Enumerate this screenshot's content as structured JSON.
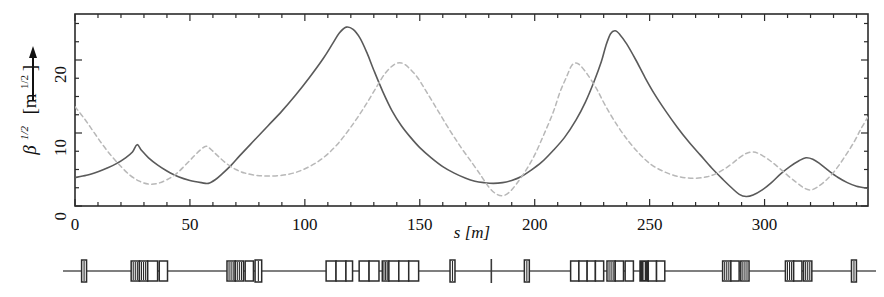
{
  "figure": {
    "title": "",
    "ylabel_main": "β",
    "ylabel_exp": "1/2",
    "ylabel_unit_open": " [m",
    "ylabel_unit_exp": "1/2",
    "ylabel_unit_close": "]",
    "xlabel": "s [m]",
    "arrow_icon": "up-arrow-icon"
  },
  "chart_data": {
    "type": "line",
    "title": "",
    "xlabel": "s [m]",
    "ylabel": "β^1/2 [m^1/2]",
    "xlim": [
      0,
      345
    ],
    "ylim": [
      0,
      26.3
    ],
    "xticks": [
      0,
      50,
      100,
      150,
      200,
      250,
      300
    ],
    "xtick_labels": [
      "0",
      "50",
      "100",
      "150",
      "200",
      "250",
      "300"
    ],
    "xminor_step": 10,
    "yticks": [
      0,
      10,
      20
    ],
    "ytick_labels": [
      "0",
      "10",
      "20"
    ],
    "yminor_step": 2.5,
    "grid": false,
    "legend": "none",
    "series": [
      {
        "name": "beta_x_sqrt",
        "style": "solid",
        "color": "#5a5a5a",
        "width": 1.6,
        "points": [
          [
            0,
            3.9
          ],
          [
            5,
            4.2
          ],
          [
            10,
            4.7
          ],
          [
            14,
            5.2
          ],
          [
            18,
            5.8
          ],
          [
            22,
            6.6
          ],
          [
            25,
            7.4
          ],
          [
            27,
            8.4
          ],
          [
            29,
            7.6
          ],
          [
            32,
            6.6
          ],
          [
            36,
            5.6
          ],
          [
            40,
            4.8
          ],
          [
            45,
            4.0
          ],
          [
            50,
            3.5
          ],
          [
            55,
            3.2
          ],
          [
            58,
            3.1
          ],
          [
            61,
            3.6
          ],
          [
            64,
            4.4
          ],
          [
            68,
            5.6
          ],
          [
            72,
            7.0
          ],
          [
            78,
            9.0
          ],
          [
            84,
            11.0
          ],
          [
            90,
            13.0
          ],
          [
            96,
            15.2
          ],
          [
            102,
            17.6
          ],
          [
            108,
            20.2
          ],
          [
            112,
            22.2
          ],
          [
            115,
            23.7
          ],
          [
            118,
            24.5
          ],
          [
            121,
            24.2
          ],
          [
            124,
            23.0
          ],
          [
            127,
            21.0
          ],
          [
            130,
            18.6
          ],
          [
            134,
            15.6
          ],
          [
            138,
            13.0
          ],
          [
            142,
            11.0
          ],
          [
            146,
            9.4
          ],
          [
            150,
            8.0
          ],
          [
            155,
            6.6
          ],
          [
            160,
            5.4
          ],
          [
            165,
            4.5
          ],
          [
            170,
            3.8
          ],
          [
            174,
            3.4
          ],
          [
            178,
            3.2
          ],
          [
            182,
            3.1
          ],
          [
            186,
            3.2
          ],
          [
            190,
            3.5
          ],
          [
            194,
            4.0
          ],
          [
            198,
            4.8
          ],
          [
            203,
            6.0
          ],
          [
            208,
            7.6
          ],
          [
            213,
            9.4
          ],
          [
            218,
            11.8
          ],
          [
            222,
            14.2
          ],
          [
            226,
            17.2
          ],
          [
            229,
            19.8
          ],
          [
            231,
            22.0
          ],
          [
            233,
            23.6
          ],
          [
            235,
            24.0
          ],
          [
            237,
            23.5
          ],
          [
            240,
            22.2
          ],
          [
            244,
            20.0
          ],
          [
            248,
            17.6
          ],
          [
            252,
            15.4
          ],
          [
            257,
            13.0
          ],
          [
            262,
            10.8
          ],
          [
            267,
            8.8
          ],
          [
            272,
            7.0
          ],
          [
            277,
            5.2
          ],
          [
            282,
            3.6
          ],
          [
            286,
            2.4
          ],
          [
            289,
            1.6
          ],
          [
            292,
            1.3
          ],
          [
            295,
            1.5
          ],
          [
            299,
            2.2
          ],
          [
            303,
            3.2
          ],
          [
            307,
            4.4
          ],
          [
            311,
            5.4
          ],
          [
            315,
            6.2
          ],
          [
            318,
            6.6
          ],
          [
            321,
            6.4
          ],
          [
            324,
            5.8
          ],
          [
            328,
            4.8
          ],
          [
            332,
            3.9
          ],
          [
            336,
            3.2
          ],
          [
            340,
            2.7
          ],
          [
            345,
            2.4
          ]
        ]
      },
      {
        "name": "beta_y_sqrt",
        "style": "dashed",
        "color": "#b8b8b8",
        "width": 1.5,
        "points": [
          [
            0,
            13.6
          ],
          [
            4,
            12.0
          ],
          [
            8,
            10.2
          ],
          [
            12,
            8.4
          ],
          [
            16,
            6.8
          ],
          [
            20,
            5.4
          ],
          [
            24,
            4.2
          ],
          [
            28,
            3.4
          ],
          [
            32,
            3.0
          ],
          [
            36,
            3.1
          ],
          [
            40,
            3.6
          ],
          [
            44,
            4.4
          ],
          [
            48,
            5.6
          ],
          [
            52,
            6.9
          ],
          [
            55,
            7.8
          ],
          [
            57,
            8.2
          ],
          [
            59,
            7.8
          ],
          [
            62,
            6.9
          ],
          [
            66,
            5.8
          ],
          [
            70,
            5.0
          ],
          [
            74,
            4.5
          ],
          [
            79,
            4.2
          ],
          [
            84,
            4.1
          ],
          [
            90,
            4.2
          ],
          [
            96,
            4.6
          ],
          [
            102,
            5.4
          ],
          [
            108,
            6.6
          ],
          [
            114,
            8.4
          ],
          [
            120,
            10.8
          ],
          [
            126,
            13.6
          ],
          [
            131,
            16.2
          ],
          [
            135,
            18.2
          ],
          [
            139,
            19.4
          ],
          [
            142,
            19.6
          ],
          [
            145,
            19.0
          ],
          [
            149,
            17.6
          ],
          [
            153,
            15.6
          ],
          [
            158,
            13.0
          ],
          [
            163,
            10.4
          ],
          [
            168,
            8.0
          ],
          [
            173,
            5.8
          ],
          [
            177,
            4.0
          ],
          [
            180,
            2.6
          ],
          [
            183,
            1.7
          ],
          [
            186,
            1.4
          ],
          [
            189,
            1.9
          ],
          [
            192,
            3.0
          ],
          [
            196,
            4.8
          ],
          [
            200,
            7.0
          ],
          [
            204,
            9.8
          ],
          [
            208,
            12.8
          ],
          [
            211,
            15.6
          ],
          [
            214,
            17.8
          ],
          [
            216,
            19.2
          ],
          [
            218,
            19.6
          ],
          [
            220,
            19.2
          ],
          [
            223,
            18.0
          ],
          [
            227,
            16.0
          ],
          [
            231,
            13.6
          ],
          [
            236,
            11.0
          ],
          [
            241,
            8.8
          ],
          [
            246,
            7.0
          ],
          [
            251,
            5.6
          ],
          [
            257,
            4.6
          ],
          [
            263,
            4.0
          ],
          [
            269,
            3.8
          ],
          [
            275,
            4.0
          ],
          [
            280,
            4.6
          ],
          [
            285,
            5.6
          ],
          [
            289,
            6.6
          ],
          [
            292,
            7.2
          ],
          [
            295,
            7.4
          ],
          [
            298,
            7.1
          ],
          [
            302,
            6.3
          ],
          [
            306,
            5.3
          ],
          [
            310,
            4.2
          ],
          [
            314,
            3.2
          ],
          [
            317,
            2.5
          ],
          [
            320,
            2.2
          ],
          [
            323,
            2.6
          ],
          [
            327,
            3.6
          ],
          [
            331,
            5.0
          ],
          [
            335,
            6.8
          ],
          [
            339,
            8.8
          ],
          [
            342,
            10.6
          ],
          [
            345,
            12.2
          ]
        ]
      }
    ]
  },
  "lattice": {
    "name": "magnet-lattice-diagram",
    "beamline_color": "#555555",
    "s_range": [
      0,
      345
    ],
    "elements": [
      {
        "s": 4,
        "length": 3,
        "type": "thin",
        "fill": "#3a3a3a"
      },
      {
        "s": 34,
        "length": 5,
        "type": "striped",
        "fill": "#ffffff"
      },
      {
        "s": 39,
        "length": 5,
        "type": "striped",
        "fill": "#ffffff"
      },
      {
        "s": 44,
        "length": 6,
        "type": "open",
        "fill": "#ffffff"
      },
      {
        "s": 51,
        "length": 5,
        "type": "open",
        "fill": "#ffffff"
      },
      {
        "s": 92,
        "length": 5,
        "type": "striped",
        "fill": "#ffffff"
      },
      {
        "s": 97,
        "length": 5,
        "type": "striped",
        "fill": "#ffffff"
      },
      {
        "s": 103,
        "length": 5,
        "type": "open",
        "fill": "#ffffff"
      },
      {
        "s": 109,
        "length": 4,
        "type": "thin",
        "fill": "#3a3a3a"
      },
      {
        "s": 152,
        "length": 6,
        "type": "open",
        "fill": "#ffffff"
      },
      {
        "s": 158,
        "length": 6,
        "type": "open",
        "fill": "#ffffff"
      },
      {
        "s": 164,
        "length": 4,
        "type": "open",
        "fill": "#ffffff"
      },
      {
        "s": 172,
        "length": 6,
        "type": "open",
        "fill": "#ffffff"
      },
      {
        "s": 178,
        "length": 6,
        "type": "open",
        "fill": "#ffffff"
      },
      {
        "s": 186,
        "length": 4,
        "type": "striped",
        "fill": "#ffffff"
      },
      {
        "s": 190,
        "length": 6,
        "type": "open",
        "fill": "#ffffff"
      },
      {
        "s": 196,
        "length": 6,
        "type": "open",
        "fill": "#ffffff"
      },
      {
        "s": 202,
        "length": 6,
        "type": "open",
        "fill": "#ffffff"
      },
      {
        "s": 227,
        "length": 3,
        "type": "thin",
        "fill": "#3a3a3a"
      },
      {
        "s": 252,
        "length": 1,
        "type": "marker",
        "fill": "#3a3a3a"
      },
      {
        "s": 272,
        "length": 3,
        "type": "thin",
        "fill": "#3a3a3a"
      },
      {
        "s": 300,
        "length": 5,
        "type": "open",
        "fill": "#ffffff"
      },
      {
        "s": 305,
        "length": 5,
        "type": "open",
        "fill": "#ffffff"
      },
      {
        "s": 310,
        "length": 5,
        "type": "open",
        "fill": "#ffffff"
      },
      {
        "s": 315,
        "length": 5,
        "type": "open",
        "fill": "#ffffff"
      },
      {
        "s": 322,
        "length": 5,
        "type": "striped",
        "fill": "#ffffff"
      },
      {
        "s": 327,
        "length": 5,
        "type": "open",
        "fill": "#ffffff"
      },
      {
        "s": 333,
        "length": 5,
        "type": "open",
        "fill": "#ffffff"
      },
      {
        "s": 342,
        "length": 5,
        "type": "solid",
        "fill": "#2a2a2a"
      },
      {
        "s": 347,
        "length": 5,
        "type": "open",
        "fill": "#ffffff"
      },
      {
        "s": 352,
        "length": 5,
        "type": "open",
        "fill": "#ffffff"
      },
      {
        "s": 392,
        "length": 5,
        "type": "striped",
        "fill": "#ffffff"
      },
      {
        "s": 397,
        "length": 5,
        "type": "open",
        "fill": "#ffffff"
      },
      {
        "s": 403,
        "length": 5,
        "type": "striped",
        "fill": "#ffffff"
      },
      {
        "s": 430,
        "length": 5,
        "type": "striped",
        "fill": "#ffffff"
      },
      {
        "s": 435,
        "length": 5,
        "type": "open",
        "fill": "#ffffff"
      },
      {
        "s": 441,
        "length": 5,
        "type": "striped",
        "fill": "#ffffff"
      },
      {
        "s": 470,
        "length": 3,
        "type": "thin",
        "fill": "#3a3a3a"
      }
    ]
  }
}
